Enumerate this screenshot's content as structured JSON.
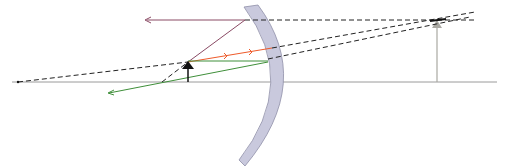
{
  "diagram": {
    "type": "ray-diagram-convex-mirror",
    "colors": {
      "background": "#ffffff",
      "axis": "#9a9a9a",
      "mirror_fill": "#c9c9dd",
      "mirror_stroke": "#8f8fa8",
      "object": "#111111",
      "image": "#a9a8a2",
      "ray_purple": "#8a4a64",
      "ray_orange": "#ee5a2a",
      "ray_green": "#3f8f3a",
      "dashed": "#222222"
    },
    "elements": {
      "axis": "optical-axis",
      "mirror": "convex-mirror",
      "object": "object-arrow",
      "image": "virtual-image-arrow",
      "rays": [
        "purple-ray",
        "orange-ray",
        "green-ray"
      ]
    }
  }
}
